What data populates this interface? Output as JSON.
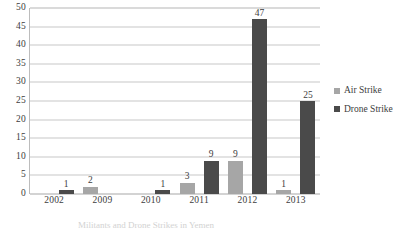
{
  "chart_data": {
    "type": "bar",
    "title": "",
    "subtitle": "",
    "xlabel": "",
    "ylabel": "",
    "categories": [
      "2002",
      "2009",
      "2010",
      "2011",
      "2012",
      "2013"
    ],
    "series": [
      {
        "name": "Air Strike",
        "color": "#a6a6a6",
        "values": [
          null,
          2,
          null,
          3,
          9,
          1
        ]
      },
      {
        "name": "Drone Strike",
        "color": "#4a4a4a",
        "values": [
          1,
          null,
          1,
          9,
          47,
          25
        ]
      }
    ],
    "ylim": [
      0,
      50
    ],
    "ytick_step": 5,
    "yticks": [
      "50",
      "45",
      "40",
      "35",
      "30",
      "25",
      "20",
      "15",
      "10",
      "5",
      "0"
    ],
    "grid": true,
    "grid_axis": "y",
    "legend_position": "right",
    "data_labels": true
  },
  "caption": {
    "text": "Militants and Drone Strikes in Yemen"
  }
}
